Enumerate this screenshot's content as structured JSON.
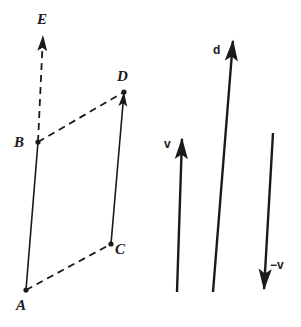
{
  "figure": {
    "width": 301,
    "height": 327,
    "background_color": "#ffffff",
    "ink_color": "#1a1a1a"
  },
  "points": {
    "A": {
      "label": "A",
      "x": 26,
      "y": 290,
      "label_x": 16,
      "label_y": 298
    },
    "B": {
      "label": "B",
      "x": 38,
      "y": 142,
      "label_x": 14,
      "label_y": 135
    },
    "C": {
      "label": "C",
      "x": 111,
      "y": 244,
      "label_x": 115,
      "label_y": 242
    },
    "D": {
      "label": "D",
      "x": 124,
      "y": 92,
      "label_x": 117,
      "label_y": 69
    },
    "E": {
      "label": "E",
      "x": 43,
      "y": 35,
      "label_x": 37,
      "label_y": 12
    }
  },
  "segments": [
    {
      "name": "segment-ab",
      "from": "A",
      "to": "B",
      "style": "solid",
      "arrow": "none"
    },
    {
      "name": "segment-cd",
      "from": "C",
      "to": "D",
      "style": "solid",
      "arrow": "end"
    },
    {
      "name": "segment-ac",
      "from": "A",
      "to": "C",
      "style": "dashed",
      "arrow": "none"
    },
    {
      "name": "segment-bd",
      "from": "B",
      "to": "D",
      "style": "dashed",
      "arrow": "none"
    },
    {
      "name": "segment-be",
      "from": "B",
      "to": "E",
      "style": "dashed",
      "arrow": "end"
    }
  ],
  "vectors": [
    {
      "name": "vector-v",
      "label": "v",
      "x1": 177,
      "y1": 292,
      "x2": 182,
      "y2": 138,
      "label_x": 164,
      "label_y": 138,
      "direction": "up"
    },
    {
      "name": "vector-d",
      "label": "d",
      "x1": 213,
      "y1": 292,
      "x2": 233,
      "y2": 40,
      "label_x": 213,
      "label_y": 44,
      "direction": "up"
    },
    {
      "name": "vector-negative-v",
      "label": "−v",
      "x1": 273,
      "y1": 133,
      "x2": 264,
      "y2": 290,
      "label_x": 270,
      "label_y": 259,
      "direction": "down"
    }
  ]
}
